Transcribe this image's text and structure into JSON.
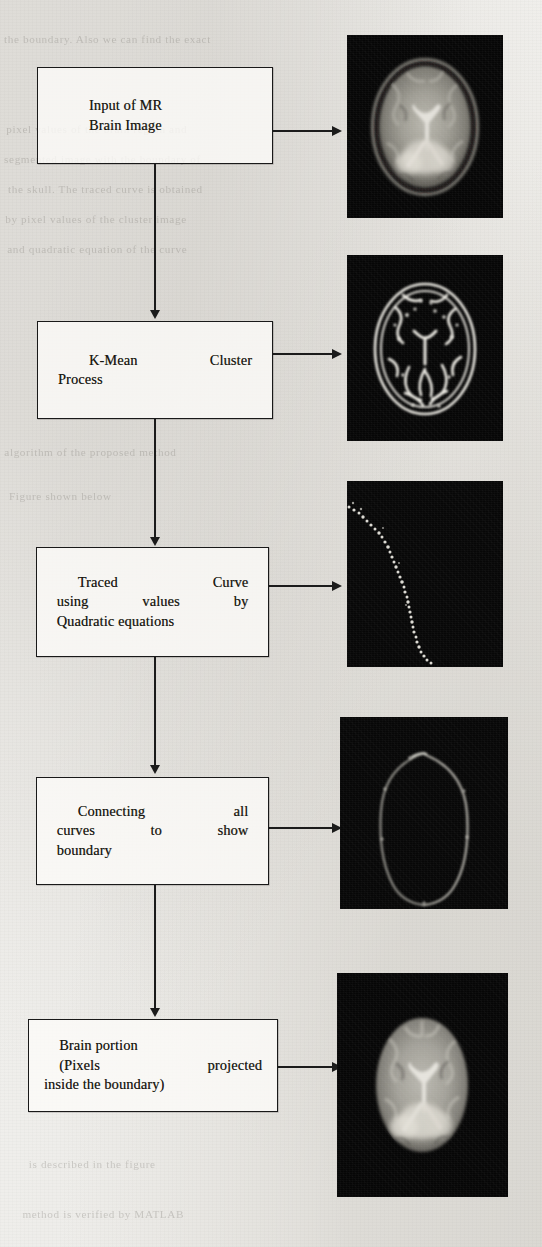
{
  "figure": {
    "type": "flowchart",
    "orientation": "vertical"
  },
  "steps": [
    {
      "id": "step-1",
      "box": {
        "lines": [
          {
            "words": [
              "Input of MR"
            ],
            "justify": false,
            "indent": 1
          },
          {
            "words": [
              "Brain Image"
            ],
            "justify": false,
            "indent": 1
          }
        ],
        "plain": "Input of MR Brain Image"
      },
      "image": {
        "name": "mr-brain-image",
        "caption": "Axial MR brain slice with skull",
        "kind": "mri-with-skull"
      }
    },
    {
      "id": "step-2",
      "box": {
        "lines": [
          {
            "words": [
              "K-Mean",
              "Cluster"
            ],
            "justify": true,
            "indent": 1
          },
          {
            "words": [
              "Process"
            ],
            "justify": false,
            "indent": 0
          }
        ],
        "plain": "K-Mean Cluster Process"
      },
      "image": {
        "name": "k-mean-cluster-result",
        "caption": "K-mean clustered edge map",
        "kind": "cluster-edges"
      }
    },
    {
      "id": "step-3",
      "box": {
        "lines": [
          {
            "words": [
              "Traced",
              "Curve"
            ],
            "justify": true,
            "indent": 2
          },
          {
            "words": [
              "using",
              "values",
              "by"
            ],
            "justify": true,
            "indent": 0
          },
          {
            "words": [
              "Quadratic equations"
            ],
            "justify": false,
            "indent": 0
          }
        ],
        "plain": "Traced Curve using values by Quadratic equations"
      },
      "image": {
        "name": "traced-curve-image",
        "caption": "Traced quadratic curve points",
        "kind": "traced-curve"
      }
    },
    {
      "id": "step-4",
      "box": {
        "lines": [
          {
            "words": [
              "Connecting",
              "all"
            ],
            "justify": true,
            "indent": 2
          },
          {
            "words": [
              "curves",
              "to",
              "show"
            ],
            "justify": true,
            "indent": 0
          },
          {
            "words": [
              "boundary"
            ],
            "justify": false,
            "indent": 0
          }
        ],
        "plain": "Connecting all curves to show boundary"
      },
      "image": {
        "name": "boundary-image",
        "caption": "Connected boundary contour",
        "kind": "boundary"
      }
    },
    {
      "id": "step-5",
      "box": {
        "lines": [
          {
            "words": [
              "Brain portion"
            ],
            "justify": false,
            "indent": 2
          },
          {
            "words": [
              "(Pixels",
              "projected"
            ],
            "justify": true,
            "indent": 2
          },
          {
            "words": [
              "inside the boundary)"
            ],
            "justify": false,
            "indent": 0
          }
        ],
        "plain": "Brain portion (Pixels projected inside the boundary)"
      },
      "image": {
        "name": "extracted-brain-image",
        "caption": "Extracted brain portion, skull removed",
        "kind": "mri-stripped"
      }
    }
  ],
  "connectors": {
    "down_arrow_label": "flows to next step",
    "right_arrow_label": "produces result image"
  },
  "colors": {
    "paper": "#f2f1ee",
    "ink": "#191919",
    "image_background": "#050505",
    "tissue_bright": "#d8d6cf",
    "tissue_mid": "#8f8d86"
  },
  "background_ghost_text": [
    "the boundary. Also we  can find  the  exact",
    "pixel   values   of   the   brain   region   and",
    "segmented  image  with  the  boundary  of",
    "the  skull.  The  traced  curve  is  obtained",
    "by  pixel  values  of  the  cluster  image",
    "and  quadratic  equation  of  the  curve",
    "algorithm  of  the  proposed  method",
    "Figure  shown  below",
    "is  described  in  the  figure",
    "method  is  verified  by  MATLAB"
  ]
}
